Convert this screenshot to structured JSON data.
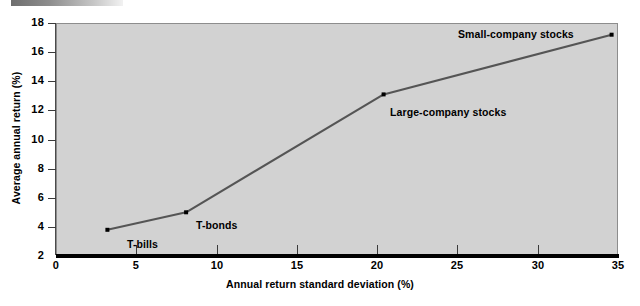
{
  "decor": {
    "top_bar_name": "gradient-rule"
  },
  "chart_data": {
    "type": "line",
    "title": "",
    "xlabel": "Annual return standard deviation (%)",
    "ylabel": "Average annual return (%)",
    "xlim": [
      0,
      35
    ],
    "ylim": [
      2,
      18
    ],
    "xticks": [
      0,
      5,
      10,
      15,
      20,
      25,
      30,
      35
    ],
    "xtick_labels": [
      "0",
      "5",
      "10",
      "15",
      "20",
      "25",
      "30",
      "35"
    ],
    "yticks": [
      2,
      4,
      6,
      8,
      10,
      12,
      14,
      16,
      18
    ],
    "ytick_labels": [
      "2",
      "4",
      "6",
      "8",
      "10",
      "12",
      "14",
      "16",
      "18"
    ],
    "grid": false,
    "legend": "none",
    "plot_background": "#d2d2d2",
    "line_color": "#555555",
    "marker_color": "#000000",
    "series": [
      {
        "name": "Risk-return tradeoff",
        "points": [
          {
            "label": "T-bills",
            "x": 3.2,
            "y": 3.8
          },
          {
            "label": "T-bonds",
            "x": 8.1,
            "y": 5.0
          },
          {
            "label": "Large-company stocks",
            "x": 20.4,
            "y": 13.1
          },
          {
            "label": "Small-company stocks",
            "x": 34.6,
            "y": 17.2
          }
        ]
      }
    ],
    "annotations": [
      {
        "text": "T-bills",
        "x": 127,
        "y": 238
      },
      {
        "text": "T-bonds",
        "x": 196,
        "y": 219
      },
      {
        "text": "Large-company stocks",
        "x": 390,
        "y": 106
      },
      {
        "text": "Small-company stocks",
        "x": 458,
        "y": 28
      }
    ]
  }
}
